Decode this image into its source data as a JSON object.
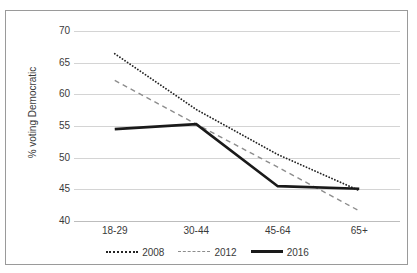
{
  "chart_data": {
    "type": "line",
    "title": "",
    "xlabel": "",
    "ylabel": "% voting Democratic",
    "categories": [
      "18-29",
      "30-44",
      "45-64",
      "65+"
    ],
    "ylim": [
      40,
      70
    ],
    "yticks": [
      70,
      65,
      60,
      55,
      50,
      45,
      40
    ],
    "grid": true,
    "legend_position": "bottom",
    "series": [
      {
        "name": "2008",
        "style": "dotted",
        "color": "#242424",
        "values": [
          66.4,
          57.6,
          50.5,
          44.8
        ]
      },
      {
        "name": "2012",
        "style": "dashed",
        "color": "#8d8d8d",
        "values": [
          62.2,
          55.3,
          48.5,
          41.6
        ]
      },
      {
        "name": "2016",
        "style": "solid",
        "color": "#1a1a1a",
        "values": [
          54.5,
          55.3,
          45.5,
          45.1
        ]
      }
    ]
  },
  "axis": {
    "y_title": "% voting Democratic",
    "y_tick_labels": [
      "70",
      "65",
      "60",
      "55",
      "50",
      "45",
      "40"
    ],
    "x_tick_labels": [
      "18-29",
      "30-44",
      "45-64",
      "65+"
    ]
  },
  "legend": {
    "items": [
      {
        "label": "2008"
      },
      {
        "label": "2012"
      },
      {
        "label": "2016"
      }
    ]
  }
}
